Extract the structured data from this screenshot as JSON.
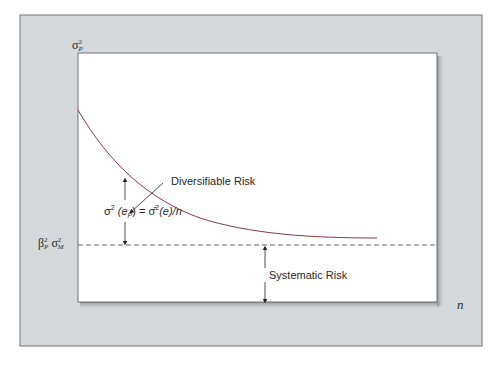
{
  "diagram": {
    "colors": {
      "frame_background": "#d5d9dc",
      "plot_background": "#ffffff",
      "curve": "#8b3a3f",
      "axis_text": "#2a2a2a",
      "dashed_line": "#555555"
    },
    "y_axis": {
      "label_symbol": "σ",
      "label_sup": "2",
      "label_sub": "P"
    },
    "x_axis": {
      "label": "n"
    },
    "systematic_level_label": {
      "beta_symbol": "β",
      "beta_sup": "2",
      "beta_sub": "P",
      "sigma_symbol": "σ",
      "sigma_sup": "2",
      "sigma_sub": "M"
    },
    "annotations": {
      "diversifiable_risk": "Diversifiable Risk",
      "systematic_risk": "Systematic Risk",
      "formula": {
        "lhs": "σ",
        "lhs_sup": "2",
        "lhs_arg": "(e",
        "lhs_arg_sub": "P",
        "lhs_close": ")",
        "equals": " = ",
        "rhs": "σ̄",
        "rhs_sup": "2",
        "rhs_arg": "(e)/",
        "rhs_n": "n"
      }
    },
    "curve": {
      "description": "Decreasing convex curve asymptotically approaching the systematic risk level",
      "start": {
        "x": 78,
        "y": 110
      },
      "end": {
        "x": 377,
        "y": 238
      }
    },
    "asymptote_y": 245
  }
}
